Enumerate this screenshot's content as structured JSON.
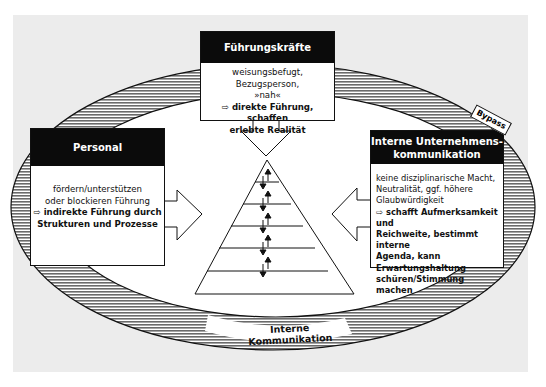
{
  "diagram": {
    "colors": {
      "background": "#ececec",
      "header": "#0b0b0b",
      "hatch": "#555555",
      "box": "#ffffff"
    },
    "top_box": {
      "title": "Führungskräfte",
      "line1": "weisungsbefugt, Bezugsperson,",
      "line2": "»nah«",
      "arrow": "⇨",
      "bold1": "direkte Führung, schaffen",
      "bold2": "erlebte Realität"
    },
    "left_box": {
      "title": "Personal",
      "line1": "fördern/unterstützen",
      "line2": "oder blockieren Führung",
      "arrow": "⇨",
      "bold1": "indirekte Führung durch",
      "bold2": "Strukturen und Prozesse"
    },
    "right_box": {
      "title1": "Interne Unternehmens-",
      "title2": "kommunikation",
      "line1": "keine disziplinarische Macht,",
      "line2": "Neutralität, ggf. höhere",
      "line3": "Glaubwürdigkeit",
      "arrow": "⇨",
      "bold1": "schafft Aufmerksamkeit und",
      "bold2": "Reichweite, bestimmt interne",
      "bold3": "Agenda, kann",
      "bold4": "Erwartungshaltung",
      "bold5": "schüren/Stimmung machen"
    },
    "bypass_label": "Bypass",
    "ring_label": "Interne Kommunikation",
    "pyramid": {
      "levels": 6,
      "arrow_pairs": 5,
      "arrow_glyph": "↓↑"
    }
  }
}
